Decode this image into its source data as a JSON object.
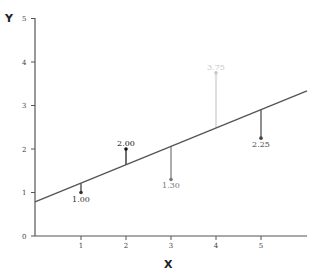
{
  "chart_data": {
    "type": "scatter",
    "title": "",
    "xlabel": "X",
    "ylabel": "Y",
    "xlim": [
      0,
      6
    ],
    "ylim": [
      0,
      5
    ],
    "x_ticks": [
      1,
      2,
      3,
      4,
      5
    ],
    "y_ticks": [
      0,
      1,
      2,
      3,
      4,
      5
    ],
    "grid": false,
    "legend": null,
    "points": [
      {
        "x": 1,
        "y": 1.0,
        "label": "1.00",
        "color": "#333333"
      },
      {
        "x": 2,
        "y": 2.0,
        "label": "2.00",
        "color": "#111111"
      },
      {
        "x": 3,
        "y": 1.3,
        "label": "1.30",
        "color": "#777777"
      },
      {
        "x": 4,
        "y": 3.75,
        "label": "3.75",
        "color": "#c8c8c8"
      },
      {
        "x": 5,
        "y": 2.25,
        "label": "2.25",
        "color": "#444444"
      }
    ],
    "regression_line": {
      "intercept": 0.785,
      "slope": 0.425,
      "x_start": 0,
      "x_end": 6
    },
    "annotations": "Vertical residual lines connect each data point to the regression line"
  },
  "axes": {
    "x_title": "X",
    "y_title": "Y"
  }
}
